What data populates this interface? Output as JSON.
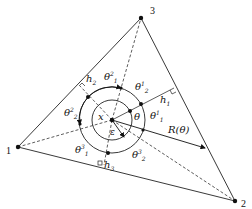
{
  "diagram": {
    "type": "geometric-triangle-polar-construction",
    "vertices": [
      {
        "id": "1",
        "label": "1",
        "x": 18,
        "y": 147
      },
      {
        "id": "2",
        "label": "2",
        "x": 235,
        "y": 201
      },
      {
        "id": "3",
        "label": "3",
        "x": 141,
        "y": 18
      }
    ],
    "center": {
      "label": "x",
      "x": 112,
      "y": 120
    },
    "inner_circle_radius_label": "ε",
    "angle_label": "θ",
    "ray_label": "R(θ)",
    "heights": [
      {
        "label": "h",
        "sub": "1"
      },
      {
        "label": "h",
        "sub": "2"
      },
      {
        "label": "h",
        "sub": "3"
      }
    ],
    "angles": [
      {
        "label": "θ",
        "sub": "1",
        "sup": "1"
      },
      {
        "label": "θ",
        "sub": "2",
        "sup": "1"
      },
      {
        "label": "θ",
        "sub": "1",
        "sup": "2"
      },
      {
        "label": "θ",
        "sub": "2",
        "sup": "2"
      },
      {
        "label": "θ",
        "sub": "1",
        "sup": "3"
      },
      {
        "label": "θ",
        "sub": "2",
        "sup": "3"
      }
    ]
  }
}
